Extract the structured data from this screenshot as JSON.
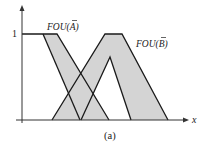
{
  "figure": {
    "caption": "(a)",
    "x_axis_label": "x",
    "y_tick_label": "1",
    "fou_a_label_prefix": "FOU(",
    "fou_a_label_symbol": "A",
    "fou_a_label_suffix": ")",
    "fou_b_label_prefix": "FOU(",
    "fou_b_label_symbol": "B",
    "fou_b_label_suffix": ")",
    "colors": {
      "fill": "#d4d4d4",
      "stroke": "#1a1a1a",
      "axis": "#333333",
      "background": "#ffffff"
    }
  },
  "shapes": {
    "fou_a": {
      "name": "FOU(Ã)",
      "type": "left-shoulder interval type-2 MF",
      "upper_mf": [
        [
          22,
          34
        ],
        [
          57,
          34
        ],
        [
          109,
          120
        ]
      ],
      "lower_mf": [
        [
          43,
          34
        ],
        [
          80,
          120
        ]
      ]
    },
    "fou_b": {
      "name": "FOU(B̃)",
      "type": "trapezoidal interval type-2 MF",
      "upper_mf": [
        [
          52,
          120
        ],
        [
          105,
          34
        ],
        [
          122,
          34
        ],
        [
          168,
          120
        ]
      ],
      "lower_mf": [
        [
          81,
          120
        ],
        [
          110,
          57
        ],
        [
          131,
          120
        ]
      ]
    }
  }
}
